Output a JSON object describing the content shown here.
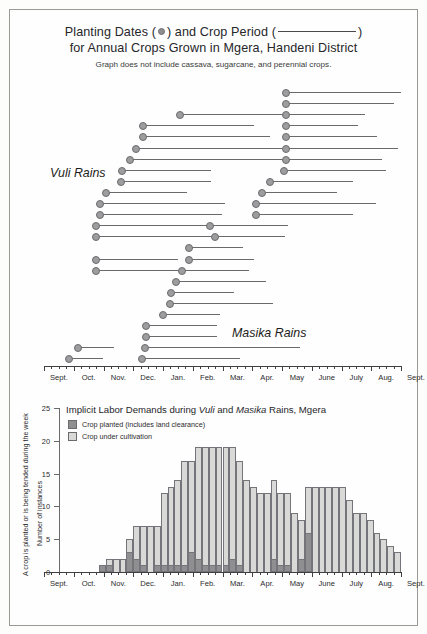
{
  "title": {
    "line1_a": "Planting Dates (",
    "line1_b": ") and Crop Period (",
    "line1_c": ")",
    "line2": "for Annual Crops Grown in Mgera, Handeni District",
    "subtitle": "Graph does not include cassava, sugarcane, and perennial crops."
  },
  "axis": {
    "months": [
      "Sept.",
      "Oct.",
      "Nov.",
      "Dec.",
      "Jan.",
      "Feb.",
      "Mar.",
      "Apr.",
      "May",
      "June",
      "July",
      "Aug.",
      "Sept."
    ]
  },
  "gantt": {
    "season_labels": [
      {
        "text": "Vuli Rains",
        "x": 40,
        "y": 78
      },
      {
        "text": "Masika Rains",
        "x": 222,
        "y": 238
      }
    ]
  },
  "barchart": {
    "title_a": "Implicit Labor Demands during ",
    "title_vuli": "Vuli",
    "title_b": " and ",
    "title_masika": "Masika",
    "title_c": " Rains, Mgera",
    "legend": [
      {
        "swatch": "dark",
        "label": "Crop planted (includes land clearance)"
      },
      {
        "swatch": "light",
        "label": "Crop under cultivation"
      }
    ],
    "y_axis_caption_outer": "A crop is planted or is being tended during the week",
    "y_axis_caption_inner": "Number of instances"
  },
  "chart_data": [
    {
      "type": "gantt",
      "title": "Planting Dates and Crop Period for Annual Crops Grown in Mgera, Handeni District",
      "subtitle": "Graph does not include cassava, sugarcane, and perennial crops.",
      "xlabel": "",
      "ylabel": "",
      "x_tick_labels": [
        "Sept.",
        "Oct.",
        "Nov.",
        "Dec.",
        "Jan.",
        "Feb.",
        "Mar.",
        "Apr.",
        "May",
        "June",
        "July",
        "Aug.",
        "Sept."
      ],
      "x_unit": "month_index_from_Sept",
      "xlim": [
        0,
        12
      ],
      "grid": false,
      "marker": "planting date (dot)",
      "bar": "crop period (line)",
      "annotations": [
        "Vuli Rains",
        "Masika Rains"
      ],
      "rows": [
        {
          "row": 1,
          "segments": [
            {
              "start": 8.1,
              "end": 12.0
            }
          ]
        },
        {
          "row": 2,
          "segments": [
            {
              "start": 8.1,
              "end": 11.75
            }
          ]
        },
        {
          "row": 3,
          "segments": [
            {
              "start": 4.55,
              "end": 8.1
            },
            {
              "start": 8.1,
              "end": 10.8
            }
          ]
        },
        {
          "row": 4,
          "segments": [
            {
              "start": 3.3,
              "end": 7.05
            },
            {
              "start": 8.1,
              "end": 10.55
            }
          ]
        },
        {
          "row": 5,
          "segments": [
            {
              "start": 3.3,
              "end": 7.6
            },
            {
              "start": 8.1,
              "end": 11.2
            }
          ]
        },
        {
          "row": 6,
          "segments": [
            {
              "start": 3.05,
              "end": 8.0
            },
            {
              "start": 8.1,
              "end": 11.9
            }
          ]
        },
        {
          "row": 7,
          "segments": [
            {
              "start": 2.85,
              "end": 8.1
            },
            {
              "start": 8.1,
              "end": 11.35
            }
          ]
        },
        {
          "row": 8,
          "segments": [
            {
              "start": 2.6,
              "end": 5.6
            },
            {
              "start": 8.05,
              "end": 11.5
            }
          ]
        },
        {
          "row": 9,
          "segments": [
            {
              "start": 2.55,
              "end": 5.6
            },
            {
              "start": 7.55,
              "end": 10.4
            }
          ]
        },
        {
          "row": 10,
          "segments": [
            {
              "start": 2.05,
              "end": 4.8
            },
            {
              "start": 7.3,
              "end": 9.85
            }
          ]
        },
        {
          "row": 11,
          "segments": [
            {
              "start": 1.85,
              "end": 6.1
            },
            {
              "start": 7.1,
              "end": 11.15
            }
          ]
        },
        {
          "row": 12,
          "segments": [
            {
              "start": 1.85,
              "end": 6.0
            },
            {
              "start": 7.1,
              "end": 10.4
            }
          ]
        },
        {
          "row": 13,
          "segments": [
            {
              "start": 1.7,
              "end": 5.55
            },
            {
              "start": 5.55,
              "end": 8.2
            }
          ]
        },
        {
          "row": 14,
          "segments": [
            {
              "start": 1.7,
              "end": 5.7
            },
            {
              "start": 5.7,
              "end": 8.1
            }
          ]
        },
        {
          "row": 15,
          "segments": [
            {
              "start": 4.85,
              "end": 6.7
            }
          ]
        },
        {
          "row": 16,
          "segments": [
            {
              "start": 1.7,
              "end": 4.5
            },
            {
              "start": 4.85,
              "end": 7.05
            }
          ]
        },
        {
          "row": 17,
          "segments": [
            {
              "start": 1.7,
              "end": 4.6
            },
            {
              "start": 4.6,
              "end": 6.9
            }
          ]
        },
        {
          "row": 18,
          "segments": [
            {
              "start": 4.4,
              "end": 7.45
            }
          ]
        },
        {
          "row": 19,
          "segments": [
            {
              "start": 4.25,
              "end": 6.4
            }
          ]
        },
        {
          "row": 20,
          "segments": [
            {
              "start": 4.2,
              "end": 7.7
            }
          ]
        },
        {
          "row": 21,
          "segments": [
            {
              "start": 3.95,
              "end": 5.9
            }
          ]
        },
        {
          "row": 22,
          "segments": [
            {
              "start": 3.4,
              "end": 5.8
            }
          ]
        },
        {
          "row": 23,
          "segments": [
            {
              "start": 3.4,
              "end": 5.8
            }
          ]
        },
        {
          "row": 24,
          "segments": [
            {
              "start": 1.1,
              "end": 2.35
            },
            {
              "start": 3.35,
              "end": 8.6
            }
          ]
        },
        {
          "row": 25,
          "segments": [
            {
              "start": 0.8,
              "end": 2.0
            },
            {
              "start": 3.25,
              "end": 6.6
            }
          ]
        }
      ]
    },
    {
      "type": "bar",
      "title": "Implicit Labor Demands during Vuli and Masika Rains, Mgera",
      "xlabel": "",
      "ylabel": "Number of instances",
      "ylabel_outer": "A crop is planted or is being tended during the week",
      "ylim": [
        0,
        25
      ],
      "y_ticks": [
        0,
        5,
        10,
        15,
        20,
        25
      ],
      "grid": false,
      "stacked": true,
      "legend_position": "top-left",
      "x_tick_labels": [
        "Sept.",
        "Oct.",
        "Nov.",
        "Dec.",
        "Jan.",
        "Feb.",
        "Mar.",
        "Apr.",
        "May",
        "June",
        "July",
        "Aug.",
        "Sept."
      ],
      "x_unit": "week",
      "n_bins": 52,
      "series": [
        {
          "name": "Crop planted (includes land clearance)",
          "color": "#8f8f91",
          "values": [
            0,
            0,
            0,
            0,
            0,
            0,
            0,
            0,
            1,
            1,
            0,
            0,
            3,
            2,
            1,
            0,
            1,
            1,
            1,
            1,
            1,
            3,
            2,
            1,
            1,
            1,
            1,
            2,
            1,
            0,
            0,
            0,
            0,
            2,
            1,
            1,
            0,
            2,
            6,
            0,
            0,
            0,
            0,
            0,
            0,
            0,
            0,
            0,
            0,
            0,
            0,
            0
          ]
        },
        {
          "name": "Crop under cultivation",
          "color": "#d9d9d7",
          "values": [
            0,
            0,
            0,
            0,
            0,
            0,
            0,
            0,
            0,
            1,
            2,
            2,
            2,
            5,
            6,
            7,
            6,
            11,
            12,
            13,
            16,
            14,
            17,
            18,
            18,
            18,
            18,
            17,
            16,
            14,
            13,
            12,
            12,
            12,
            11,
            11,
            9,
            6,
            7,
            13,
            13,
            13,
            13,
            13,
            11,
            9,
            9,
            8,
            6,
            5,
            4,
            3
          ]
        },
        {
          "name": "Total (stack height)",
          "color": "#ffffff",
          "values": [
            0,
            0,
            0,
            0,
            0,
            0,
            0,
            0,
            1,
            2,
            2,
            2,
            5,
            7,
            7,
            7,
            7,
            12,
            13,
            14,
            17,
            17,
            19,
            19,
            19,
            19,
            19,
            19,
            17,
            14,
            13,
            12,
            12,
            14,
            12,
            12,
            9,
            8,
            13,
            13,
            13,
            13,
            13,
            13,
            11,
            9,
            9,
            8,
            6,
            5,
            4,
            3,
            1
          ]
        }
      ]
    }
  ]
}
